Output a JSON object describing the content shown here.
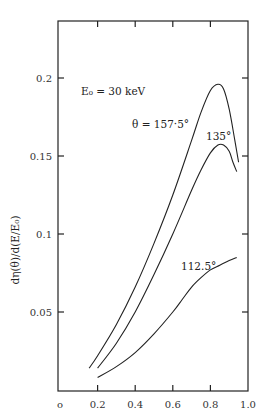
{
  "chart_data": {
    "type": "line",
    "title": "",
    "xlabel": "",
    "ylabel": "dη(θ)/d(E/E₀)",
    "xlim": [
      0,
      1.0
    ],
    "ylim": [
      0,
      0.24
    ],
    "grid": false,
    "x_ticks": [
      "0",
      "0.2",
      "0.4",
      "0.6",
      "0.8",
      "1.0"
    ],
    "y_ticks": [
      "0.05",
      "0.1",
      "0.15",
      "0.2"
    ],
    "annotations": [
      {
        "text": "E₀ = 30 keV",
        "x": 0.33,
        "y": 0.19
      },
      {
        "text": "θ = 157.5°",
        "x": 0.6,
        "y": 0.174
      },
      {
        "text": "135°",
        "x": 0.84,
        "y": 0.163
      },
      {
        "text": "112.5°",
        "x": 0.72,
        "y": 0.077
      }
    ],
    "series": [
      {
        "name": "θ = 157.5°",
        "x": [
          0.155,
          0.2,
          0.3,
          0.4,
          0.5,
          0.6,
          0.7,
          0.75,
          0.8,
          0.84,
          0.87,
          0.9,
          0.93,
          0.95
        ],
        "y": [
          0.014,
          0.022,
          0.042,
          0.066,
          0.094,
          0.125,
          0.16,
          0.178,
          0.192,
          0.196,
          0.193,
          0.18,
          0.16,
          0.146
        ]
      },
      {
        "name": "135°",
        "x": [
          0.2,
          0.3,
          0.4,
          0.5,
          0.6,
          0.7,
          0.75,
          0.8,
          0.84,
          0.87,
          0.9,
          0.92,
          0.94
        ],
        "y": [
          0.014,
          0.03,
          0.05,
          0.074,
          0.1,
          0.128,
          0.141,
          0.152,
          0.157,
          0.157,
          0.153,
          0.146,
          0.14
        ]
      },
      {
        "name": "112.5°",
        "x": [
          0.2,
          0.3,
          0.4,
          0.5,
          0.6,
          0.65,
          0.7,
          0.75,
          0.8,
          0.85,
          0.9,
          0.94
        ],
        "y": [
          0.008,
          0.015,
          0.024,
          0.036,
          0.05,
          0.058,
          0.066,
          0.072,
          0.077,
          0.08,
          0.083,
          0.085
        ]
      }
    ]
  },
  "labels": {
    "ylabel": "dη(θ)/d(E/E₀)",
    "energy": "E₀ = 30 keV",
    "theta_157": "θ = 157·5°",
    "theta_135": "135°",
    "theta_112": "112.5°"
  },
  "axis": {
    "x_ticks": [
      "o",
      "0.2",
      "0.4",
      "0.6",
      "0.8",
      "1.0"
    ],
    "y_ticks": [
      "0.05",
      "0.1",
      "0.15",
      "0.2"
    ]
  }
}
